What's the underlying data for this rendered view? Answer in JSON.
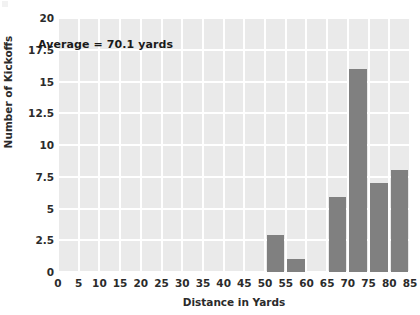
{
  "chart_data": {
    "type": "bar",
    "title": "",
    "subtitle": "",
    "xlabel": "Distance in Yards",
    "ylabel": "Number of Kickoffs",
    "xlim": [
      0,
      85
    ],
    "ylim": [
      0,
      20
    ],
    "grid": true,
    "legend": null,
    "bin_width": 5,
    "x_tick_labels": [
      "0",
      "5",
      "10",
      "15",
      "20",
      "25",
      "30",
      "35",
      "40",
      "45",
      "50",
      "55",
      "60",
      "65",
      "70",
      "75",
      "80",
      "85"
    ],
    "x_tick_values": [
      0,
      5,
      10,
      15,
      20,
      25,
      30,
      35,
      40,
      45,
      50,
      55,
      60,
      65,
      70,
      75,
      80,
      85
    ],
    "y_tick_labels": [
      "0",
      "2.5",
      "5",
      "7.5",
      "10",
      "12.5",
      "15",
      "17.5",
      "20"
    ],
    "y_tick_values": [
      0,
      2.5,
      5,
      7.5,
      10,
      12.5,
      15,
      17.5,
      20
    ],
    "categories": [
      "0-5",
      "5-10",
      "10-15",
      "15-20",
      "20-25",
      "25-30",
      "30-35",
      "35-40",
      "40-45",
      "45-50",
      "50-55",
      "55-60",
      "60-65",
      "65-70",
      "70-75",
      "75-80",
      "80-85"
    ],
    "bins": [
      {
        "start": 0,
        "end": 5,
        "value": 0
      },
      {
        "start": 5,
        "end": 10,
        "value": 0
      },
      {
        "start": 10,
        "end": 15,
        "value": 0
      },
      {
        "start": 15,
        "end": 20,
        "value": 0
      },
      {
        "start": 20,
        "end": 25,
        "value": 0
      },
      {
        "start": 25,
        "end": 30,
        "value": 0
      },
      {
        "start": 30,
        "end": 35,
        "value": 0
      },
      {
        "start": 35,
        "end": 40,
        "value": 0
      },
      {
        "start": 40,
        "end": 45,
        "value": 0
      },
      {
        "start": 45,
        "end": 50,
        "value": 0
      },
      {
        "start": 50,
        "end": 55,
        "value": 2.9
      },
      {
        "start": 55,
        "end": 60,
        "value": 1
      },
      {
        "start": 60,
        "end": 65,
        "value": 0
      },
      {
        "start": 65,
        "end": 70,
        "value": 5.9
      },
      {
        "start": 70,
        "end": 75,
        "value": 16
      },
      {
        "start": 75,
        "end": 80,
        "value": 7
      },
      {
        "start": 80,
        "end": 85,
        "value": 8
      }
    ],
    "values": [
      0,
      0,
      0,
      0,
      0,
      0,
      0,
      0,
      0,
      0,
      2.9,
      1,
      0,
      5.9,
      16,
      7,
      8
    ],
    "annotations": [
      {
        "text": "Average = 70.1 yards",
        "x": 15,
        "y": 17
      }
    ],
    "colors": {
      "bar": "#808080",
      "plot_background": "#eaeaea",
      "gridline": "#ffffff",
      "figure_background": "#ffffff",
      "text": "#2b2b2b",
      "annotation_text": "#1a1a1a"
    }
  },
  "annotation_text": "Average = 70.1 yards"
}
